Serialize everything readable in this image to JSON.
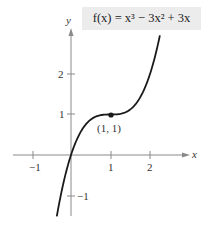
{
  "chart_data": {
    "type": "line",
    "title": "f(x) = x³ − 3x² + 3x",
    "function": "x^3 - 3x^2 + 3x",
    "xlabel": "x",
    "ylabel": "y",
    "xlim": [
      -1.45,
      2.95
    ],
    "ylim": [
      -1.55,
      3.2
    ],
    "x_ticks": [
      -1,
      1,
      2
    ],
    "x_tick_labels": [
      "−1",
      "1",
      "2"
    ],
    "y_ticks": [
      -1,
      1,
      2
    ],
    "y_tick_labels": [
      "−1",
      "1",
      "2"
    ],
    "grid": false,
    "series": [
      {
        "name": "f(x) = x³ − 3x² + 3x",
        "x": [
          -0.36,
          -0.2,
          0,
          0.25,
          0.5,
          0.75,
          1,
          1.25,
          1.5,
          1.75,
          2,
          2.25
        ],
        "y": [
          -1.52,
          -0.73,
          0,
          0.58,
          0.88,
          0.98,
          1,
          1.02,
          1.13,
          1.42,
          2,
          2.95
        ]
      }
    ],
    "annotations": [
      {
        "point": [
          1,
          1
        ],
        "label": "(1, 1)",
        "marker": "filled-dot"
      }
    ],
    "colors": {
      "curve": "#1a1a1a",
      "axis": "#8a8a8a",
      "label_box": "#ececec"
    }
  },
  "labels": {
    "function_label": "f(x) = x³ − 3x² + 3x",
    "x_axis": "x",
    "y_axis": "y",
    "point": "(1, 1)"
  }
}
